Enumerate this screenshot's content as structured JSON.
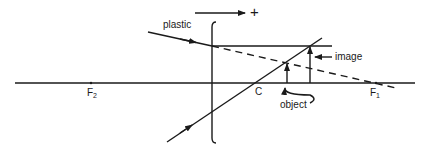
{
  "diagram": {
    "type": "ray-diagram",
    "colors": {
      "ink": "#1a1a1a",
      "background": "#ffffff"
    },
    "labels": {
      "material": "plastic",
      "direction_sign": "+",
      "image": "image",
      "object": "object",
      "center": "C",
      "focal_left": "F",
      "focal_left_sub": "2",
      "focal_right": "F",
      "focal_right_sub": "1"
    },
    "elements": [
      "optical axis",
      "lens (bracket shape)",
      "incident ray from upper left",
      "horizontal refracted ray",
      "dashed extension line toward F1",
      "incident ray from lower left through C",
      "object arrow",
      "image arrow",
      "direction arrow pointing right"
    ]
  }
}
